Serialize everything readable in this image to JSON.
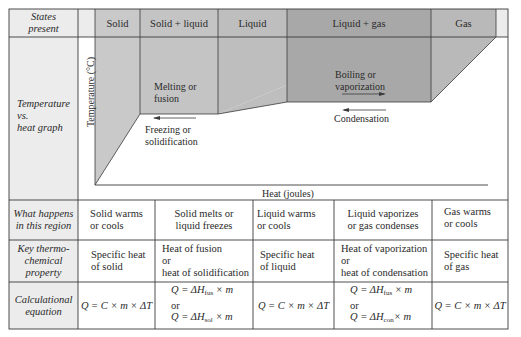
{
  "colors": {
    "label_bg": "#ececec",
    "solid_shade": "#c9c9c9",
    "solid_liquid_shade": "#c2c2c2",
    "liquid_shade": "#bdbdbd",
    "liquid_gas_shade": "#a9a9a9",
    "gas_shade": "#b9b9b9",
    "line": "#3a3a3a"
  },
  "row_labels": {
    "states": [
      "States",
      "present"
    ],
    "graph": [
      "Temperature",
      "vs.",
      "heat graph"
    ],
    "what": [
      "What happens",
      "in this region"
    ],
    "key": [
      "Key thermo-",
      "chemical",
      "property"
    ],
    "calc": [
      "Calculational",
      "equation"
    ]
  },
  "states": [
    "Solid",
    "Solid + liquid",
    "Liquid",
    "Liquid + gas",
    "Gas"
  ],
  "graph": {
    "y_axis_label": "Temperature (°C)",
    "x_axis_label": "Heat (joules)",
    "melting_label": [
      "Melting or",
      "fusion"
    ],
    "freezing_label": [
      "Freezing or",
      "solidification"
    ],
    "boiling_label": [
      "Boiling or",
      "vaporization"
    ],
    "condensation_label": "Condensation"
  },
  "what_happens": [
    [
      "Solid warms",
      "or cools"
    ],
    [
      "Solid melts or",
      "liquid freezes"
    ],
    [
      "Liquid warms",
      "or cools"
    ],
    [
      "Liquid vaporizes",
      "or gas condenses"
    ],
    [
      "Gas warms",
      "or cools"
    ]
  ],
  "key_property": [
    [
      "Specific heat",
      "of solid"
    ],
    [
      "Heat of fusion",
      "or",
      "heat of solidification"
    ],
    [
      "Specific heat",
      "of liquid"
    ],
    [
      "Heat of vaporization",
      "or",
      "heat of condensation"
    ],
    [
      "Specific heat",
      "of gas"
    ]
  ],
  "equations": {
    "solid": "Q = C × m × ΔT",
    "solid_liquid": {
      "eq1_pre": "Q = ΔH",
      "eq1_sub": "fus",
      "eq1_post": " × m",
      "or": "or",
      "eq2_pre": "Q = ΔH",
      "eq2_sub": "sol",
      "eq2_post": " × m"
    },
    "liquid": "Q = C × m × ΔT",
    "liquid_gas": {
      "eq1_pre": "Q = ΔH",
      "eq1_sub": "fus",
      "eq1_post": " × m",
      "or": "or",
      "eq2_pre": "Q = ΔH",
      "eq2_sub": "con",
      "eq2_post": "× m"
    },
    "gas": "Q = C × m × ΔT"
  }
}
